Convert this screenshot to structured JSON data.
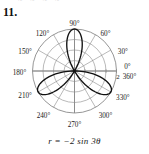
{
  "figure": {
    "problem_number": "11.",
    "equation": "r = −2 sin 3θ",
    "bleed_text": "~ ~ ~ ~"
  },
  "colors": {
    "curve": "#111111",
    "grid": "#8a8a8a",
    "axis": "#8a8a8a",
    "label": "#1a1a1a",
    "background": "#ffffff"
  },
  "chart_data": {
    "type": "line",
    "plot_kind": "polar",
    "title": "",
    "subtitle": "",
    "xlabel": "",
    "ylabel": "",
    "equation": "r = -2 sin(3θ)",
    "curve_name": "three-petaled rose",
    "grid": true,
    "legend": null,
    "rlim": [
      0,
      2
    ],
    "r_ticks": [
      0.5,
      1,
      1.5,
      2
    ],
    "r_tick_labels": [
      "",
      "",
      "",
      "2"
    ],
    "r_tick_label_shown": "2",
    "theta_ticks": [
      0,
      30,
      60,
      90,
      120,
      150,
      180,
      210,
      240,
      270,
      300,
      330
    ],
    "theta_tick_labels": [
      "0°",
      "30°",
      "60°",
      "90°",
      "120°",
      "150°",
      "180°",
      "210°",
      "240°",
      "270°",
      "300°",
      "330°"
    ],
    "extra_angle_labels": [
      "360°"
    ],
    "petal_count": 3,
    "petal_peak_angles_deg": [
      90,
      210,
      330
    ],
    "petal_max_radius": 2,
    "theta_range_deg": [
      0,
      360
    ],
    "samples_deg_step": 1,
    "series": [
      {
        "name": "r = -2 sin 3θ",
        "formula_r_of_theta": "-2*sin(3*theta)",
        "points_polar_r_theta": [
          [
            0.0,
            0
          ],
          [
            -1.0,
            10
          ],
          [
            -1.73,
            20
          ],
          [
            -2.0,
            30
          ],
          [
            -1.73,
            40
          ],
          [
            -1.0,
            50
          ],
          [
            0.0,
            60
          ],
          [
            1.0,
            70
          ],
          [
            1.73,
            80
          ],
          [
            2.0,
            90
          ],
          [
            1.73,
            100
          ],
          [
            1.0,
            110
          ],
          [
            0.0,
            120
          ],
          [
            -1.0,
            130
          ],
          [
            -1.73,
            140
          ],
          [
            -2.0,
            150
          ],
          [
            -1.73,
            160
          ],
          [
            -1.0,
            170
          ],
          [
            0.0,
            180
          ],
          [
            1.0,
            190
          ],
          [
            1.73,
            200
          ],
          [
            2.0,
            210
          ],
          [
            1.73,
            220
          ],
          [
            1.0,
            230
          ],
          [
            0.0,
            240
          ],
          [
            -1.0,
            250
          ],
          [
            -1.73,
            260
          ],
          [
            -2.0,
            270
          ],
          [
            -1.73,
            280
          ],
          [
            -1.0,
            290
          ],
          [
            0.0,
            300
          ],
          [
            1.0,
            310
          ],
          [
            1.73,
            320
          ],
          [
            2.0,
            330
          ],
          [
            1.73,
            340
          ],
          [
            1.0,
            350
          ],
          [
            0.0,
            360
          ]
        ]
      }
    ]
  }
}
